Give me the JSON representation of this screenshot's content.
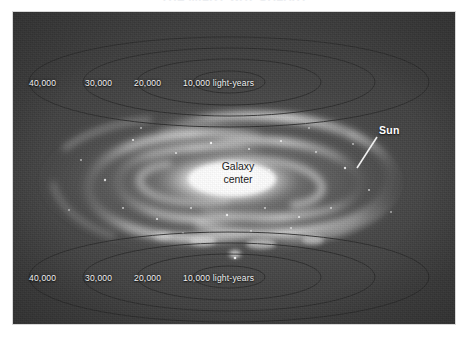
{
  "figure": {
    "title": "THE MILKY WAY GALAXY",
    "background_color": "#434343",
    "panel_border_color": "#d8d8d8"
  },
  "annotations": {
    "galaxy_center": {
      "line1": "Galaxy",
      "line2": "center",
      "color": "#1b1b1b"
    },
    "sun": {
      "label": "Sun",
      "color": "#ffffff",
      "leader_line": {
        "from_x": 364,
        "from_y": 125,
        "to_x": 344,
        "to_y": 156
      }
    }
  },
  "scale_rings": {
    "unit": "light-years",
    "top_set": [
      {
        "value": "40,000",
        "x": 16,
        "y": 66
      },
      {
        "value": "30,000",
        "x": 72,
        "y": 66
      },
      {
        "value": "20,000",
        "x": 121,
        "y": 66
      },
      {
        "value": "10,000 light-years",
        "x": 170,
        "y": 66
      }
    ],
    "bottom_set": [
      {
        "value": "40,000",
        "x": 16,
        "y": 261
      },
      {
        "value": "30,000",
        "x": 72,
        "y": 261
      },
      {
        "value": "20,000",
        "x": 121,
        "y": 261
      },
      {
        "value": "10,000 light-years",
        "x": 170,
        "y": 261
      }
    ],
    "ring_stroke_color": "#2b2b2b",
    "ellipse_radii_x": [
      36,
      92,
      146,
      200
    ],
    "ellipse_radii_y": [
      11,
      23,
      34,
      45
    ]
  },
  "galaxy": {
    "core_color": "#f4f4f4",
    "arm_color": "#cfcfcf",
    "description": "face-on spiral galaxy with bright elongated central bulge and multiple trailing spiral arms"
  }
}
